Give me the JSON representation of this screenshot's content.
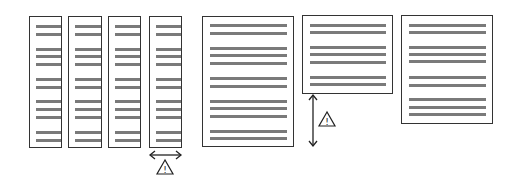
{
  "diagram": {
    "narrow_columns": [
      {
        "id": "col-1",
        "x": 29,
        "y": 16,
        "w": 33,
        "h": 132
      },
      {
        "id": "col-2",
        "x": 68,
        "y": 16,
        "w": 34,
        "h": 132
      },
      {
        "id": "col-3",
        "x": 108,
        "y": 16,
        "w": 33,
        "h": 132
      },
      {
        "id": "col-4",
        "x": 149,
        "y": 16,
        "w": 33,
        "h": 132
      }
    ],
    "narrow_line_y": [
      9,
      17,
      32,
      39,
      47,
      62,
      70,
      84,
      92,
      100,
      115,
      123
    ],
    "wide_pages": [
      {
        "id": "page-tall",
        "x": 202,
        "y": 16,
        "w": 92,
        "h": 131,
        "line_y": [
          8,
          16,
          31,
          38,
          46,
          61,
          69,
          84,
          91,
          99,
          114,
          121
        ]
      },
      {
        "id": "page-short",
        "x": 302,
        "y": 15,
        "w": 91,
        "h": 79,
        "line_y": [
          9,
          16,
          31,
          38,
          46,
          61,
          68
        ]
      },
      {
        "id": "page-medium",
        "x": 401,
        "y": 15,
        "w": 92,
        "h": 109,
        "line_y": [
          9,
          16,
          31,
          38,
          45,
          61,
          69,
          83,
          91,
          98
        ]
      }
    ],
    "annotations": {
      "horizontal_arrow": {
        "label": "width-change",
        "x1": 149,
        "x2": 182,
        "y": 155
      },
      "horizontal_warning": {
        "symbol": "!",
        "x": 165,
        "y": 167
      },
      "vertical_arrow": {
        "label": "height-change",
        "x": 313,
        "y1": 95,
        "y2": 147
      },
      "vertical_warning": {
        "symbol": "!",
        "x": 327,
        "y": 120
      }
    },
    "colors": {
      "border": "#333333",
      "line": "#7a7a7a",
      "arrow": "#222222"
    }
  }
}
